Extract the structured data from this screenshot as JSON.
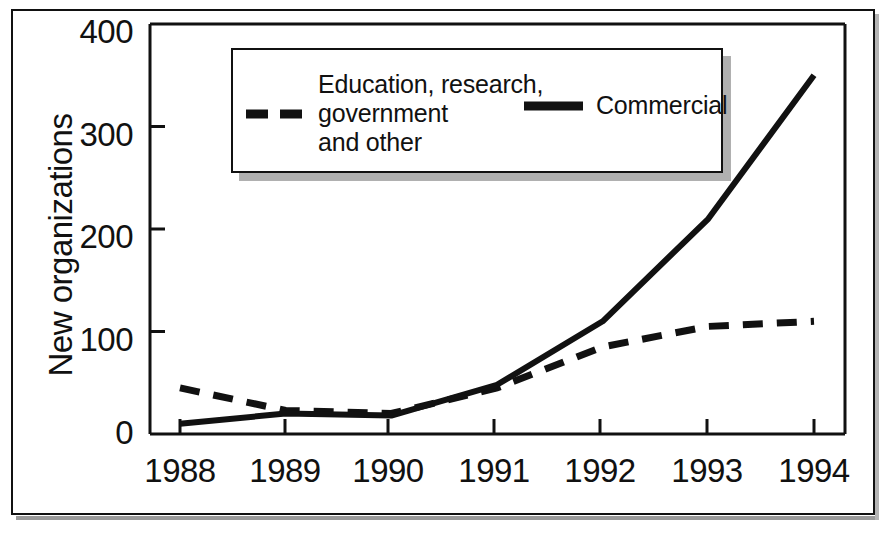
{
  "chart_data": {
    "type": "line",
    "title": "",
    "subtitle": "",
    "xlabel": "",
    "ylabel": "New organizations",
    "categories": [
      "1988",
      "1989",
      "1990",
      "1991",
      "1992",
      "1993",
      "1994"
    ],
    "x": [
      1988,
      1989,
      1990,
      1991,
      1992,
      1993,
      1994
    ],
    "xlim": [
      1988,
      1994
    ],
    "ylim": [
      0,
      400
    ],
    "yticks": [
      "0",
      "100",
      "200",
      "300",
      "400"
    ],
    "ytick_values": [
      0,
      100,
      200,
      300,
      400
    ],
    "grid": false,
    "legend_position": "top-center",
    "series": [
      {
        "name": "Education, research,\ngovernment\nand other",
        "style": "dashed",
        "color": "#111111",
        "values": [
          45,
          23,
          20,
          45,
          85,
          105,
          110
        ]
      },
      {
        "name": "Commercial",
        "style": "solid",
        "color": "#111111",
        "values": [
          10,
          20,
          18,
          48,
          110,
          210,
          350
        ]
      }
    ]
  },
  "axis": {
    "y_title": "New organizations",
    "y_ticks": [
      {
        "label": "400",
        "value": 400
      },
      {
        "label": "300",
        "value": 300
      },
      {
        "label": "200",
        "value": 200
      },
      {
        "label": "100",
        "value": 100
      },
      {
        "label": "0",
        "value": 0
      }
    ],
    "x_ticks": [
      {
        "label": "1988",
        "value": 1988
      },
      {
        "label": "1989",
        "value": 1989
      },
      {
        "label": "1990",
        "value": 1990
      },
      {
        "label": "1991",
        "value": 1991
      },
      {
        "label": "1992",
        "value": 1992
      },
      {
        "label": "1993",
        "value": 1993
      },
      {
        "label": "1994",
        "value": 1994
      }
    ]
  },
  "legend": {
    "entries": [
      {
        "label": "Education, research,\ngovernment\nand other",
        "style": "dashed"
      },
      {
        "label": "Commercial",
        "style": "solid"
      }
    ]
  },
  "colors": {
    "ink": "#111111",
    "paper": "#ffffff",
    "shadow": "#b0b0b0"
  }
}
